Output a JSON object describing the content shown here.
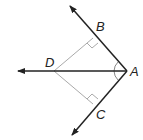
{
  "diagram": {
    "type": "geometry",
    "points": {
      "A": {
        "label": "A",
        "x": 127,
        "y": 71
      },
      "B": {
        "label": "B",
        "x": 93,
        "y": 38
      },
      "C": {
        "label": "C",
        "x": 93,
        "y": 104
      },
      "D": {
        "label": "D",
        "x": 54,
        "y": 71
      }
    },
    "rays": [
      {
        "from": "A",
        "through": "B",
        "tip": {
          "x": 70,
          "y": 6
        }
      },
      {
        "from": "A",
        "through": "C",
        "tip": {
          "x": 72,
          "y": 135
        }
      },
      {
        "from": "A",
        "through": "D",
        "tip": {
          "x": 18,
          "y": 71
        }
      }
    ],
    "segments": [
      {
        "from": "D",
        "to": "B"
      },
      {
        "from": "D",
        "to": "C"
      }
    ],
    "right_angle_marks": [
      "B",
      "C"
    ],
    "angle_marks": [
      "BAD",
      "DAC"
    ],
    "colors": {
      "ray": "#222222",
      "segment": "#aaaaaa",
      "label": "#222222"
    }
  }
}
